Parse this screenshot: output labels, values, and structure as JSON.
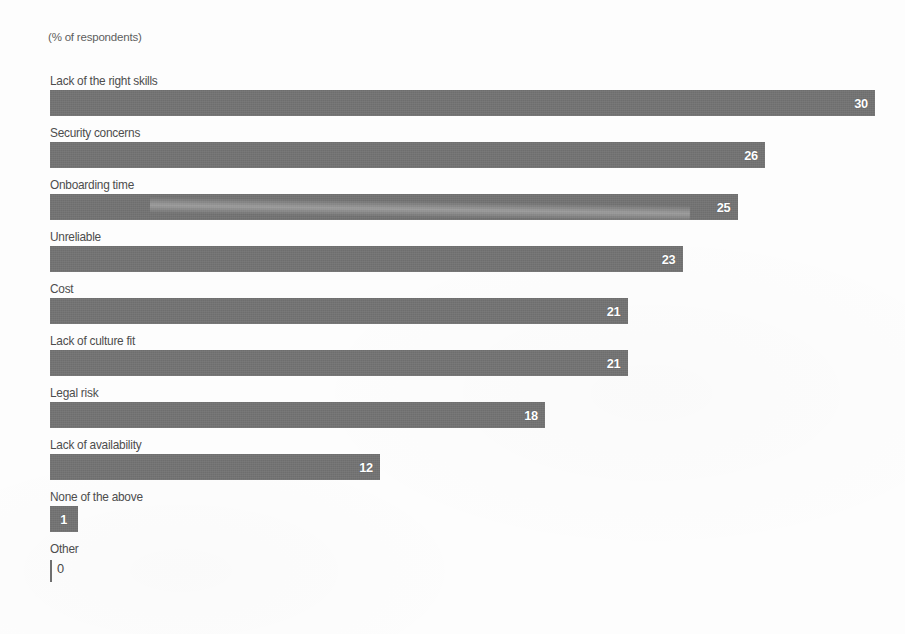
{
  "subtitle": "(% of respondents)",
  "chart_data": {
    "type": "bar",
    "orientation": "horizontal",
    "title": "",
    "subtitle": "(% of respondents)",
    "xlabel": "",
    "ylabel": "",
    "grid": false,
    "legend": false,
    "value_label_position": "inside-end",
    "category_label_position": "above-bar",
    "bar_color": "#6e6e6e",
    "value_label_color": "#ffffff",
    "category_label_color": "#4d4d4d",
    "background_color": "#ffffff",
    "xlim": [
      0,
      30
    ],
    "categories": [
      "Lack of the right skills",
      "Security concerns",
      "Onboarding time",
      "Unreliable",
      "Cost",
      "Lack of culture fit",
      "Legal risk",
      "Lack of availability",
      "None of the above",
      "Other"
    ],
    "values": [
      30,
      26,
      25,
      23,
      21,
      21,
      18,
      12,
      1,
      0
    ],
    "value_labels": [
      "30",
      "26",
      "25",
      "23",
      "21",
      "21",
      "18",
      "12",
      "1",
      "0"
    ]
  }
}
